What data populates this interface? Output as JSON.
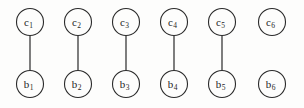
{
  "figure": {
    "background_color": "#fdfdfc",
    "node_stroke_color": "#2b2b2b",
    "node_fill_color": "#fdfdfc",
    "edge_color": "#3a3a3a",
    "label_color": "#1d1d1d"
  },
  "layout": {
    "width": 304,
    "height": 108,
    "top_row_y": 22,
    "bottom_row_y": 84,
    "node_radius": 13.5,
    "column_x": [
      30,
      78,
      126,
      174,
      222,
      272
    ]
  },
  "top_nodes": [
    {
      "id": "c1",
      "base": "c",
      "sub": "1",
      "x": 30,
      "y": 22
    },
    {
      "id": "c2",
      "base": "c",
      "sub": "2",
      "x": 78,
      "y": 22
    },
    {
      "id": "c3",
      "base": "c",
      "sub": "3",
      "x": 126,
      "y": 22
    },
    {
      "id": "c4",
      "base": "c",
      "sub": "4",
      "x": 174,
      "y": 22
    },
    {
      "id": "c5",
      "base": "c",
      "sub": "5",
      "x": 222,
      "y": 22
    },
    {
      "id": "c6",
      "base": "c",
      "sub": "6",
      "x": 272,
      "y": 22
    }
  ],
  "bottom_nodes": [
    {
      "id": "b1",
      "base": "b",
      "sub": "1",
      "x": 30,
      "y": 84
    },
    {
      "id": "b2",
      "base": "b",
      "sub": "2",
      "x": 78,
      "y": 84
    },
    {
      "id": "b3",
      "base": "b",
      "sub": "3",
      "x": 126,
      "y": 84
    },
    {
      "id": "b4",
      "base": "b",
      "sub": "4",
      "x": 174,
      "y": 84
    },
    {
      "id": "b5",
      "base": "b",
      "sub": "5",
      "x": 222,
      "y": 84
    },
    {
      "id": "b6",
      "base": "b",
      "sub": "6",
      "x": 272,
      "y": 84
    }
  ],
  "edges": [
    {
      "id": "edge-c1-b1",
      "from": "c1",
      "to": "b1",
      "x": 30,
      "y1": 35.5,
      "y2": 70.5
    },
    {
      "id": "edge-c2-b2",
      "from": "c2",
      "to": "b2",
      "x": 78,
      "y1": 35.5,
      "y2": 70.5
    },
    {
      "id": "edge-c3-b3",
      "from": "c3",
      "to": "b3",
      "x": 126,
      "y1": 35.5,
      "y2": 70.5
    },
    {
      "id": "edge-c4-b4",
      "from": "c4",
      "to": "b4",
      "x": 174,
      "y1": 35.5,
      "y2": 70.5
    },
    {
      "id": "edge-c5-b5",
      "from": "c5",
      "to": "b5",
      "x": 222,
      "y1": 35.5,
      "y2": 70.5
    }
  ],
  "unconnected": [
    "c6",
    "b6"
  ]
}
